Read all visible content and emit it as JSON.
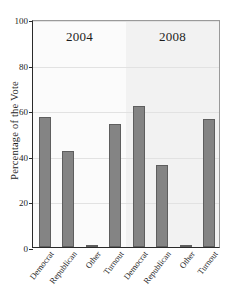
{
  "chart_data": {
    "type": "bar",
    "title": "",
    "xlabel": "",
    "ylabel": "Percentage of the Vote",
    "ylim": [
      0,
      100
    ],
    "yticks": [
      0,
      20,
      40,
      60,
      80,
      100
    ],
    "grid": true,
    "legend": "none",
    "panels": [
      {
        "label": "2004",
        "categories": [
          "Democrat",
          "Republican",
          "Other",
          "Turnout"
        ],
        "values": [
          57,
          42,
          1,
          54
        ]
      },
      {
        "label": "2008",
        "categories": [
          "Democrat",
          "Republican",
          "Other",
          "Turnout"
        ],
        "values": [
          62,
          36,
          1,
          56
        ]
      }
    ],
    "bar_color": "#848484",
    "bar_border_color": "#5e5e5e"
  },
  "figure": {
    "title_fragment": "",
    "axis_color": "#2a2a2a",
    "panel_colors": [
      "#fbfbfb",
      "#f2f2f2"
    ]
  }
}
